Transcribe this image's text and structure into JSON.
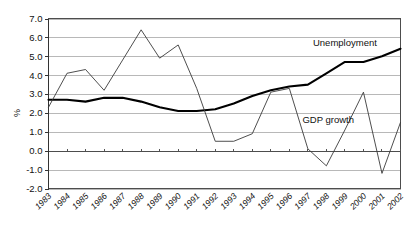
{
  "chart_data": {
    "type": "line",
    "title": "",
    "xlabel": "",
    "ylabel": "%",
    "ylim": [
      -2.0,
      7.0
    ],
    "ytick_step": 1.0,
    "yticks": [
      "7.0",
      "6.0",
      "5.0",
      "4.0",
      "3.0",
      "2.0",
      "1.0",
      "0.0",
      "-1.0",
      "-2.0"
    ],
    "ytick_values": [
      7.0,
      6.0,
      5.0,
      4.0,
      3.0,
      2.0,
      1.0,
      0.0,
      -1.0,
      -2.0
    ],
    "grid": true,
    "grid_axis": "y",
    "legend": "inline-annotations",
    "categories": [
      "1983",
      "1984",
      "1985",
      "1986",
      "1987",
      "1988",
      "1989",
      "1990",
      "1991",
      "1992",
      "1993",
      "1994",
      "1995",
      "1996",
      "1997",
      "1998",
      "1999",
      "2000",
      "2001",
      "2002"
    ],
    "x": [
      1983,
      1984,
      1985,
      1986,
      1987,
      1988,
      1989,
      1990,
      1991,
      1992,
      1993,
      1994,
      1995,
      1996,
      1997,
      1998,
      1999,
      2000,
      2001,
      2002
    ],
    "series": [
      {
        "name": "Unemployment",
        "style": "thick",
        "label_text": "Unemployment",
        "values": [
          2.7,
          2.7,
          2.6,
          2.8,
          2.8,
          2.6,
          2.3,
          2.1,
          2.1,
          2.2,
          2.5,
          2.9,
          3.2,
          3.4,
          3.5,
          4.1,
          4.7,
          4.7,
          5.0,
          5.4
        ]
      },
      {
        "name": "GDP growth",
        "style": "thin",
        "label_text": "GDP growth",
        "values": [
          2.3,
          4.1,
          4.3,
          3.2,
          4.8,
          6.4,
          4.9,
          5.6,
          3.3,
          0.5,
          0.5,
          0.9,
          3.1,
          3.3,
          0.1,
          -0.8,
          1.1,
          3.1,
          -1.2,
          1.5
        ]
      }
    ],
    "annotations": [
      {
        "text": "Unemployment",
        "x_year": 1999,
        "y_value": 5.55
      },
      {
        "text": "GDP growth",
        "x_year": 1998.1,
        "y_value": 1.45
      }
    ]
  },
  "colors": {
    "background": "#ffffff",
    "gridline": "#9a9a9a",
    "frame": "#4d4d4d",
    "axis": "#333333",
    "thick_series": "#000000",
    "thin_series": "#3a3a3a",
    "text": "#111111"
  }
}
